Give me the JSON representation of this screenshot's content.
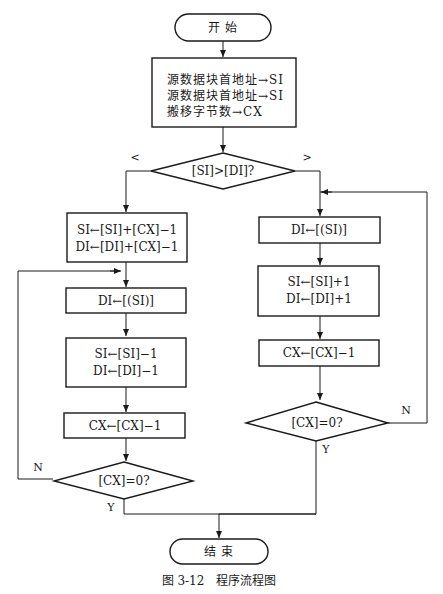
{
  "figure": {
    "caption": "图 3-12　程序流程图"
  },
  "nodes": {
    "start": {
      "type": "terminal",
      "label": "开 始"
    },
    "init": {
      "type": "process",
      "lines": [
        "源数据块首地址→SI",
        "源数据块首地址→SI",
        "搬移字节数→CX"
      ]
    },
    "compare": {
      "type": "decision",
      "label": "[SI]>[DI]?"
    },
    "left_setup": {
      "type": "process",
      "lines": [
        "SI←[SI]+[CX]−1",
        "DI←[DI]+[CX]−1"
      ]
    },
    "left_move": {
      "type": "process",
      "label": "DI←[(SI)]"
    },
    "left_dec": {
      "type": "process",
      "lines": [
        "SI←[SI]−1",
        "DI←[DI]−1"
      ]
    },
    "left_cx": {
      "type": "process",
      "label": "CX←[CX]−1"
    },
    "left_test": {
      "type": "decision",
      "label": "[CX]=0?"
    },
    "right_move": {
      "type": "process",
      "label": "DI←[(SI)]"
    },
    "right_inc": {
      "type": "process",
      "lines": [
        "SI←[SI]+1",
        "DI←[DI]+1"
      ]
    },
    "right_cx": {
      "type": "process",
      "label": "CX←[CX]−1"
    },
    "right_test": {
      "type": "decision",
      "label": "[CX]=0?"
    },
    "end": {
      "type": "terminal",
      "label": "结 束"
    }
  },
  "edge_labels": {
    "compare_less": "<",
    "compare_greater": ">",
    "left_no": "N",
    "left_yes": "Y",
    "right_no": "N",
    "right_yes": "Y"
  }
}
